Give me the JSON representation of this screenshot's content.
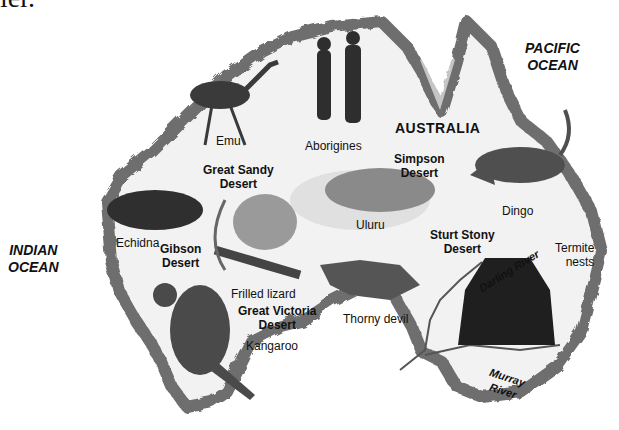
{
  "page_fragment": "ier.",
  "map": {
    "title": "AUSTRALIA",
    "oceans": [
      {
        "line1": "PACIFIC",
        "line2": "OCEAN"
      },
      {
        "line1": "INDIAN",
        "line2": "OCEAN"
      }
    ],
    "deserts": [
      {
        "line1": "Great Sandy",
        "line2": "Desert"
      },
      {
        "line1": "Gibson",
        "line2": "Desert"
      },
      {
        "line1": "Great Victoria",
        "line2": "Desert"
      },
      {
        "line1": "Simpson",
        "line2": "Desert"
      },
      {
        "line1": "Sturt Stony",
        "line2": "Desert"
      }
    ],
    "rivers": [
      {
        "label": "Darling River"
      },
      {
        "label": "Murray",
        "line2": "River"
      }
    ],
    "features": [
      {
        "label": "Uluru"
      },
      {
        "label": "Aborigines"
      }
    ],
    "animals": [
      {
        "label": "Emu"
      },
      {
        "label": "Echidna"
      },
      {
        "label": "Frilled lizard"
      },
      {
        "label": "Kangaroo"
      },
      {
        "label": "Thorny devil"
      },
      {
        "label": "Dingo"
      },
      {
        "label": "Termite",
        "line2": "nests"
      }
    ],
    "colors": {
      "coast": "#6e6e6e",
      "land": "#f2f2f2",
      "ink": "#111111"
    }
  }
}
